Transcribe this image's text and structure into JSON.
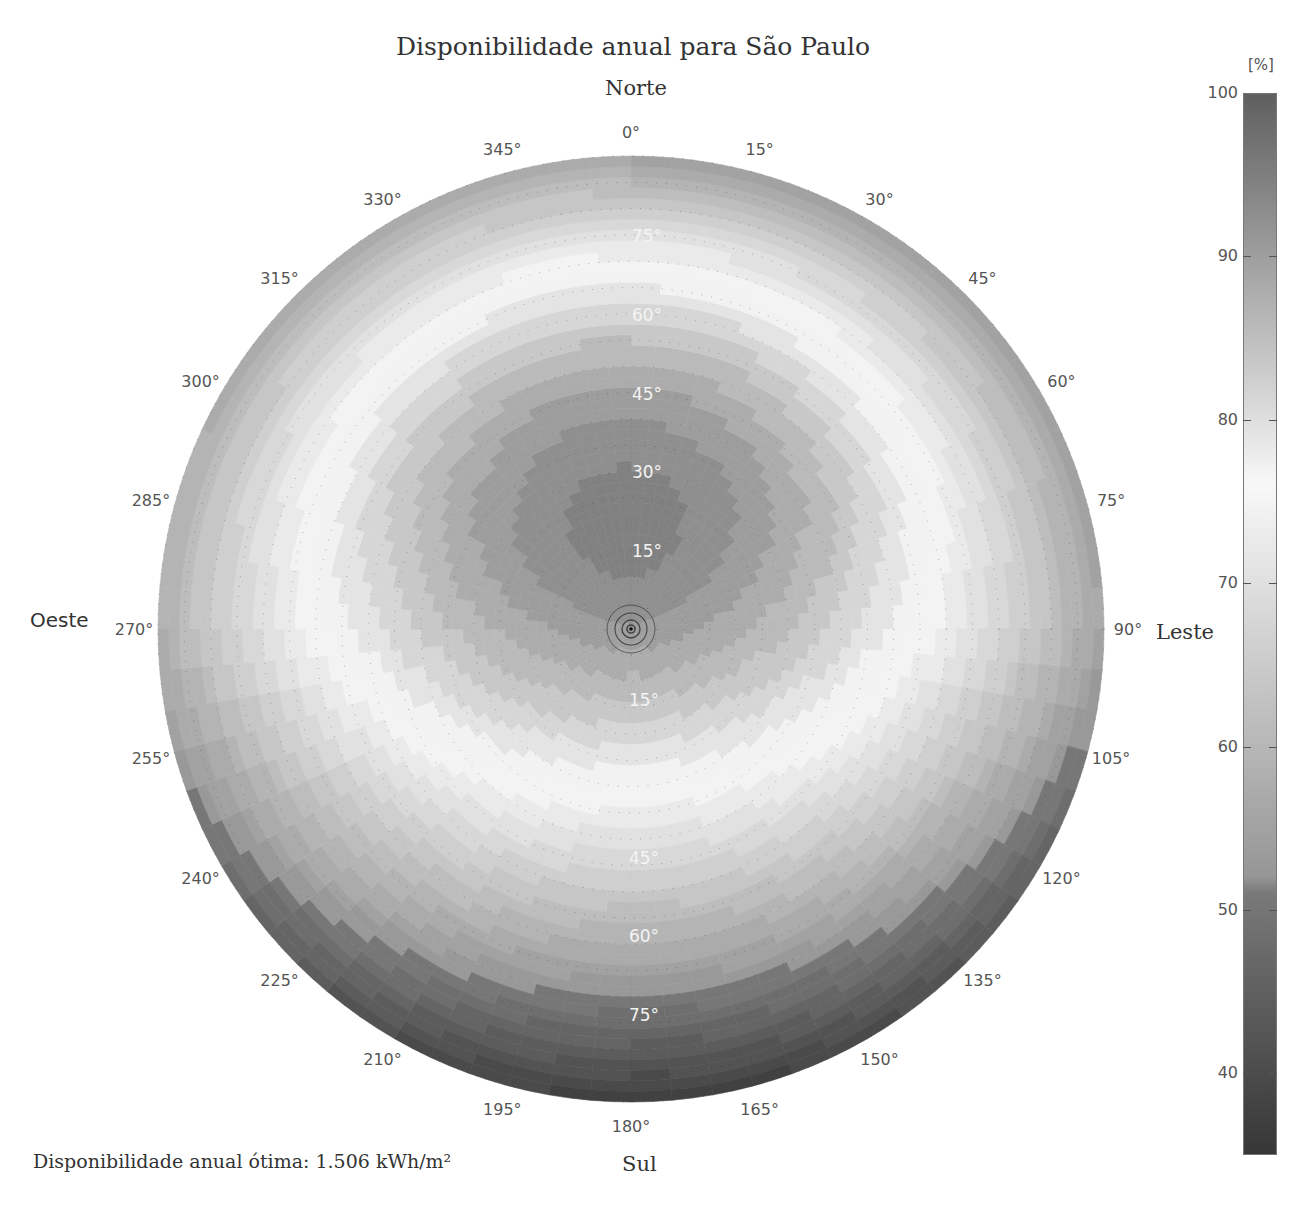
{
  "title": "Disponibilidade anual para São Paulo",
  "directions": {
    "north": "Norte",
    "south": "Sul",
    "east": "Leste",
    "west": "Oeste"
  },
  "footnote": "Disponibilidade anual ótima: 1.506 kWh/m²",
  "colorbar": {
    "unit": "[%]",
    "ticks": [
      "100",
      "90",
      "80",
      "70",
      "60",
      "50",
      "40"
    ],
    "tick_values": [
      100,
      90,
      80,
      70,
      60,
      50,
      40
    ],
    "min": 35,
    "max": 100
  },
  "chart_data": {
    "type": "heatmap",
    "subtype": "polar",
    "title": "Disponibilidade anual para São Paulo",
    "angular_axis": {
      "label": "Azimute (orientação)",
      "ticks": [
        "0°",
        "15°",
        "30°",
        "45°",
        "60°",
        "75°",
        "90°",
        "105°",
        "120°",
        "135°",
        "150°",
        "165°",
        "180°",
        "195°",
        "210°",
        "225°",
        "240°",
        "255°",
        "270°",
        "285°",
        "300°",
        "315°",
        "330°",
        "345°"
      ],
      "direction": "clockwise",
      "zero_at": "top"
    },
    "radial_axis": {
      "label": "Inclinação",
      "ticks_upper": [
        "15°",
        "30°",
        "45°",
        "60°",
        "75°"
      ],
      "ticks_lower": [
        "15°",
        "30°",
        "45°",
        "60°",
        "75°"
      ],
      "range": [
        0,
        90
      ]
    },
    "colorbar": {
      "label": "[%]",
      "range": [
        35,
        100
      ],
      "ticks": [
        40,
        50,
        60,
        70,
        80,
        90,
        100
      ]
    },
    "annotation": "Disponibilidade anual ótima: 1.506 kWh/m²",
    "samples": [
      {
        "azimuth": 0,
        "tilt": 0,
        "value": 91
      },
      {
        "azimuth": 0,
        "tilt": 15,
        "value": 98
      },
      {
        "azimuth": 0,
        "tilt": 30,
        "value": 99
      },
      {
        "azimuth": 0,
        "tilt": 45,
        "value": 92
      },
      {
        "azimuth": 0,
        "tilt": 60,
        "value": 82
      },
      {
        "azimuth": 0,
        "tilt": 75,
        "value": 75
      },
      {
        "azimuth": 0,
        "tilt": 90,
        "value": 62
      },
      {
        "azimuth": 90,
        "tilt": 30,
        "value": 86
      },
      {
        "azimuth": 90,
        "tilt": 60,
        "value": 73
      },
      {
        "azimuth": 90,
        "tilt": 90,
        "value": 56
      },
      {
        "azimuth": 180,
        "tilt": 15,
        "value": 84
      },
      {
        "azimuth": 180,
        "tilt": 30,
        "value": 75
      },
      {
        "azimuth": 180,
        "tilt": 45,
        "value": 64
      },
      {
        "azimuth": 180,
        "tilt": 60,
        "value": 55
      },
      {
        "azimuth": 180,
        "tilt": 75,
        "value": 44
      },
      {
        "azimuth": 180,
        "tilt": 90,
        "value": 37
      },
      {
        "azimuth": 270,
        "tilt": 30,
        "value": 86
      },
      {
        "azimuth": 270,
        "tilt": 60,
        "value": 73
      },
      {
        "azimuth": 270,
        "tilt": 90,
        "value": 58
      }
    ]
  }
}
